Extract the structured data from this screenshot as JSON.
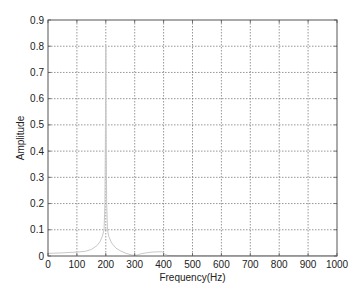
{
  "chart_data": {
    "type": "line",
    "title": "",
    "xlabel": "Frequency(Hz)",
    "ylabel": "Amplitude",
    "xlim": [
      0,
      1000
    ],
    "ylim": [
      0,
      0.9
    ],
    "grid": true,
    "legend": null,
    "x_ticks": [
      0,
      100,
      200,
      300,
      400,
      500,
      600,
      700,
      800,
      900,
      1000
    ],
    "y_ticks": [
      0,
      0.1,
      0.2,
      0.3,
      0.4,
      0.5,
      0.6,
      0.7,
      0.8,
      0.9
    ],
    "x_tick_labels": [
      "0",
      "100",
      "200",
      "300",
      "400",
      "500",
      "600",
      "700",
      "800",
      "900",
      "1000"
    ],
    "y_tick_labels": [
      "0",
      "0.1",
      "0.2",
      "0.3",
      "0.4",
      "0.5",
      "0.6",
      "0.7",
      "0.8",
      "0.9"
    ],
    "series": [
      {
        "name": "Amplitude spectrum",
        "color": "#c8c8c8",
        "x": [
          0,
          50,
          100,
          130,
          150,
          170,
          180,
          188,
          194,
          197,
          199,
          200,
          201,
          203,
          206,
          210,
          220,
          235,
          250,
          270,
          290,
          300,
          310,
          320,
          340,
          360,
          380,
          395,
          400,
          405,
          415,
          450,
          500,
          600,
          700,
          800,
          900,
          1000
        ],
        "y": [
          0.01,
          0.012,
          0.015,
          0.018,
          0.025,
          0.04,
          0.055,
          0.075,
          0.1,
          0.2,
          0.5,
          0.8,
          0.5,
          0.2,
          0.1,
          0.075,
          0.05,
          0.03,
          0.02,
          0.01,
          0.004,
          0.002,
          0.004,
          0.008,
          0.012,
          0.015,
          0.016,
          0.016,
          0.012,
          0.006,
          0.002,
          0.001,
          0.001,
          0.001,
          0.001,
          0.001,
          0.001,
          0.001
        ]
      }
    ]
  },
  "colors": {
    "axes": "#555555",
    "grid": "#6a6a6a",
    "line": "#c8c8c8",
    "background": "#ffffff"
  }
}
